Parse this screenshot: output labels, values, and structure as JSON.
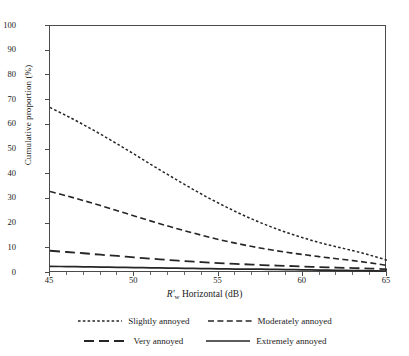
{
  "chart_data": {
    "type": "line",
    "title": "",
    "xlabel": "R'w Horizontal (dB)",
    "xlabel_parts": {
      "symbol": "R",
      "prime": "′",
      "subscript": "w",
      "rest": " Horizontal (dB)"
    },
    "ylabel": "Cumulative proportion (%)",
    "xlim": [
      45,
      65
    ],
    "ylim": [
      0,
      100
    ],
    "xticks": [
      45,
      50,
      55,
      60,
      65
    ],
    "xtick_labels": [
      "45",
      "50",
      "55",
      "60",
      "65"
    ],
    "yticks": [
      0,
      10,
      20,
      30,
      40,
      50,
      60,
      70,
      80,
      90,
      100
    ],
    "ytick_labels": [
      "0",
      "10",
      "20",
      "30",
      "40",
      "50",
      "60",
      "70",
      "80",
      "90",
      "100"
    ],
    "grid": false,
    "legend_position": "below-axes",
    "x": [
      45,
      46,
      47,
      48,
      49,
      50,
      51,
      52,
      53,
      54,
      55,
      56,
      57,
      58,
      59,
      60,
      61,
      62,
      63,
      64,
      65
    ],
    "series": [
      {
        "name": "Slightly annoyed",
        "dash": "dotted",
        "color": "#262626",
        "values": [
          67.0,
          63.6,
          60.0,
          56.2,
          52.2,
          48.1,
          43.9,
          39.8,
          35.8,
          31.9,
          28.3,
          24.9,
          21.8,
          19.0,
          16.5,
          14.3,
          12.3,
          10.6,
          9.0,
          7.2,
          5.2
        ]
      },
      {
        "name": "Moderately annoyed",
        "dash": "dashed",
        "color": "#262626",
        "values": [
          33.0,
          31.2,
          29.3,
          27.3,
          25.2,
          23.1,
          21.0,
          19.0,
          17.1,
          15.3,
          13.6,
          12.1,
          10.7,
          9.5,
          8.4,
          7.5,
          6.6,
          5.8,
          5.0,
          4.1,
          3.1
        ]
      },
      {
        "name": "Very annoyed",
        "dash": "long-dash",
        "color": "#262626",
        "values": [
          9.0,
          8.5,
          8.0,
          7.4,
          6.9,
          6.3,
          5.8,
          5.3,
          4.8,
          4.4,
          4.0,
          3.7,
          3.4,
          3.1,
          2.9,
          2.6,
          2.4,
          2.2,
          2.0,
          1.8,
          1.5
        ]
      },
      {
        "name": "Extremely annoyed",
        "dash": "solid",
        "color": "#262626",
        "values": [
          2.7,
          2.6,
          2.5,
          2.4,
          2.3,
          2.2,
          2.1,
          2.0,
          1.9,
          1.8,
          1.7,
          1.6,
          1.55,
          1.5,
          1.4,
          1.3,
          1.2,
          1.1,
          1.0,
          0.9,
          0.8
        ]
      }
    ]
  },
  "legend": {
    "rows": [
      [
        {
          "label": "Slightly annoyed",
          "dash": "dotted"
        },
        {
          "label": "Moderately annoyed",
          "dash": "dashed"
        }
      ],
      [
        {
          "label": "Very annoyed",
          "dash": "long-dash"
        },
        {
          "label": "Extremely annoyed",
          "dash": "solid"
        }
      ]
    ]
  }
}
